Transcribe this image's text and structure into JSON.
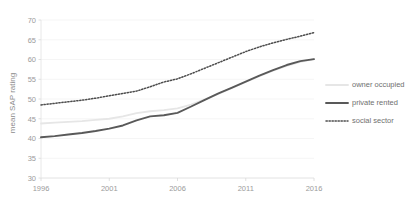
{
  "chart_data": {
    "type": "line",
    "title": "",
    "xlabel": "",
    "ylabel": "mean SAP rating",
    "xlim": [
      1996,
      2016
    ],
    "ylim": [
      30,
      70
    ],
    "ytick_step": 5,
    "grid": true,
    "legend_position": "right",
    "xticks": [
      "1996",
      "2001",
      "2006",
      "2011",
      "2016"
    ],
    "yticks": [
      "30",
      "35",
      "40",
      "45",
      "50",
      "55",
      "60",
      "65",
      "70"
    ],
    "x": [
      1996,
      1997,
      1998,
      1999,
      2000,
      2001,
      2002,
      2003,
      2004,
      2005,
      2006,
      2007,
      2008,
      2009,
      2010,
      2011,
      2012,
      2013,
      2014,
      2015,
      2016
    ],
    "series": [
      {
        "name": "owner occupied",
        "color": "#e6e6e6",
        "style": "solid",
        "width": 1.8,
        "values": [
          43.8,
          44.0,
          44.2,
          44.4,
          44.7,
          45.0,
          45.6,
          46.4,
          46.9,
          47.2,
          47.6,
          48.6,
          49.9,
          51.3,
          52.8,
          54.3,
          55.8,
          57.2,
          58.4,
          59.4,
          60.1
        ]
      },
      {
        "name": "private rented",
        "color": "#595959",
        "style": "solid",
        "width": 1.9,
        "values": [
          40.3,
          40.6,
          41.0,
          41.4,
          41.9,
          42.5,
          43.3,
          44.6,
          45.6,
          45.9,
          46.5,
          48.1,
          49.8,
          51.4,
          52.9,
          54.4,
          55.9,
          57.3,
          58.6,
          59.6,
          60.1
        ]
      },
      {
        "name": "social sector",
        "color": "#4d4d4d",
        "style": "dotted",
        "width": 1.5,
        "values": [
          48.5,
          48.9,
          49.3,
          49.7,
          50.2,
          50.8,
          51.4,
          52.0,
          53.1,
          54.3,
          55.1,
          56.4,
          57.8,
          59.2,
          60.6,
          62.0,
          63.2,
          64.2,
          65.1,
          65.9,
          66.8
        ]
      }
    ],
    "legend": [
      {
        "label": "owner occupied",
        "color": "#e6e6e6",
        "style": "solid"
      },
      {
        "label": "private rented",
        "color": "#595959",
        "style": "solid"
      },
      {
        "label": "social sector",
        "color": "#4d4d4d",
        "style": "dotted"
      }
    ]
  }
}
